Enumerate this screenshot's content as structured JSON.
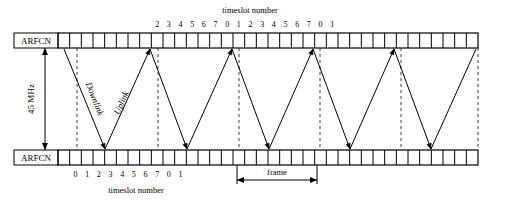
{
  "figure": {
    "title_top": "timeslot number",
    "title_bottom": "timeslot number",
    "frequency_label": "45 MHz",
    "frame_label": "frame",
    "downlink_label": "Downlink",
    "uplink_label": "Uplink",
    "arfcn_top_label": "ARFCN",
    "arfcn_bottom_label": "ARFCN"
  },
  "chart_data": {
    "type": "diagram",
    "axis_labels": {
      "top_bar": "ARFCN",
      "bottom_bar": "ARFCN",
      "vertical_separation": "45 MHz",
      "top_timeslot_caption": "timeslot number",
      "bottom_timeslot_caption": "timeslot number",
      "frame_span": "frame"
    },
    "top_timeslot_numbers": [
      "2",
      "3",
      "4",
      "5",
      "6",
      "7",
      "0",
      "1",
      "2",
      "3",
      "4",
      "5",
      "6",
      "7",
      "0",
      "1"
    ],
    "bottom_timeslot_numbers": [
      "0",
      "1",
      "2",
      "3",
      "4",
      "5",
      "6",
      "7",
      "0",
      "1"
    ],
    "top_bar": {
      "x_start": 58,
      "x_end": 478,
      "y": 33,
      "height": 15,
      "cell_count": 36,
      "cell_width": 11.67
    },
    "bottom_bar": {
      "x_start": 58,
      "x_end": 478,
      "y": 150,
      "height": 15,
      "cell_count": 36,
      "cell_width": 11.67
    },
    "frame_boundaries_x": [
      77,
      158,
      239,
      320,
      401,
      478
    ],
    "frame_width_px": 81,
    "uplink_arrow_tips_x": [
      150,
      232,
      313,
      394
    ],
    "downlink_arrow_tips_x": [
      105,
      187,
      269,
      350,
      431
    ],
    "zigzag_start_x": 64,
    "zigzag_note": "Uplink bursts travel from the lower ARFCN up to the higher ARFCN; Downlink bursts travel from the higher ARFCN down to the lower ARFCN, offset by three timeslots.",
    "frame_marker": {
      "x_start": 237,
      "x_end": 317,
      "y": 180
    },
    "separation_arrow": {
      "x": 45,
      "y_top": 48,
      "y_bottom": 150
    },
    "legend": [
      {
        "name": "Downlink",
        "description": "descending diagonal burst path"
      },
      {
        "name": "Uplink",
        "description": "ascending diagonal burst path"
      }
    ],
    "grid": false,
    "colors": {
      "line": "#000000",
      "dashed": "#3a3a3a",
      "background": "#ffffff"
    }
  }
}
